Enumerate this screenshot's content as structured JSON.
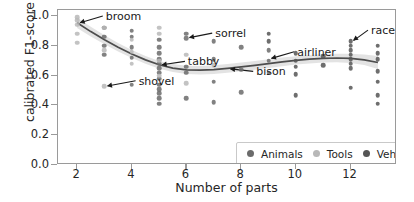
{
  "chart_data": {
    "type": "scatter",
    "title": "",
    "xlabel": "Number of parts",
    "ylabel": "calibrated F1-score",
    "xlim": [
      1.3,
      13.7
    ],
    "ylim": [
      0.0,
      1.04
    ],
    "xticks": [
      2,
      4,
      6,
      8,
      10,
      12
    ],
    "xtick_labels": [
      "2",
      "4",
      "6",
      "8",
      "10",
      "12"
    ],
    "yticks": [
      0.0,
      0.2,
      0.4,
      0.6,
      0.8,
      1.0
    ],
    "ytick_labels": [
      "0.0",
      "0.2",
      "0.4",
      "0.6",
      "0.8",
      "1.0"
    ],
    "grid": false,
    "legend_position": "lower right",
    "legend": [
      {
        "label": "Animals",
        "color": "#6b6b6b"
      },
      {
        "label": "Tools",
        "color": "#b8b8b8"
      },
      {
        "label": "Vehicles",
        "color": "#555555"
      }
    ],
    "series": [
      {
        "name": "Animals",
        "color": "#6b6b6b",
        "points": [
          [
            3.0,
            0.92
          ],
          [
            3.0,
            0.86
          ],
          [
            3.0,
            0.8
          ],
          [
            3.0,
            0.74
          ],
          [
            4.0,
            0.9
          ],
          [
            4.0,
            0.86
          ],
          [
            4.0,
            0.79
          ],
          [
            4.0,
            0.72
          ],
          [
            4.0,
            0.54
          ],
          [
            5.0,
            0.84
          ],
          [
            5.0,
            0.79
          ],
          [
            5.0,
            0.75
          ],
          [
            5.0,
            0.71
          ],
          [
            5.0,
            0.68
          ],
          [
            5.0,
            0.65
          ],
          [
            5.0,
            0.62
          ],
          [
            5.0,
            0.58
          ],
          [
            5.0,
            0.54
          ],
          [
            5.0,
            0.51
          ],
          [
            5.0,
            0.48
          ],
          [
            5.0,
            0.45
          ],
          [
            5.0,
            0.41
          ],
          [
            6.0,
            0.88
          ],
          [
            6.0,
            0.85
          ],
          [
            6.0,
            0.66
          ],
          [
            6.0,
            0.62
          ],
          [
            6.0,
            0.45
          ],
          [
            7.0,
            0.83
          ],
          [
            7.0,
            0.71
          ],
          [
            7.0,
            0.56
          ],
          [
            7.0,
            0.42
          ],
          [
            8.0,
            0.79
          ],
          [
            8.0,
            0.64
          ],
          [
            8.0,
            0.49
          ],
          [
            9.0,
            0.77
          ],
          [
            9.0,
            0.7
          ],
          [
            9.0,
            0.62
          ]
        ]
      },
      {
        "name": "Tools",
        "color": "#b8b8b8",
        "points": [
          [
            2.0,
            0.99
          ],
          [
            2.0,
            0.97
          ],
          [
            2.0,
            0.94
          ],
          [
            2.0,
            0.88
          ],
          [
            2.0,
            0.82
          ],
          [
            3.0,
            0.92
          ],
          [
            3.0,
            0.77
          ],
          [
            3.0,
            0.53
          ],
          [
            4.0,
            0.84
          ],
          [
            4.0,
            0.76
          ],
          [
            4.0,
            0.68
          ],
          [
            5.0,
            0.92
          ],
          [
            5.0,
            0.88
          ],
          [
            5.0,
            0.7
          ],
          [
            5.0,
            0.6
          ],
          [
            6.0,
            0.74
          ],
          [
            6.0,
            0.55
          ],
          [
            7.0,
            0.67
          ]
        ]
      },
      {
        "name": "Vehicles",
        "color": "#555555",
        "points": [
          [
            9.0,
            0.88
          ],
          [
            9.0,
            0.83
          ],
          [
            10.0,
            0.75
          ],
          [
            10.0,
            0.7
          ],
          [
            10.0,
            0.66
          ],
          [
            10.0,
            0.61
          ],
          [
            10.0,
            0.47
          ],
          [
            11.0,
            0.73
          ],
          [
            11.0,
            0.67
          ],
          [
            12.0,
            0.83
          ],
          [
            12.0,
            0.8
          ],
          [
            12.0,
            0.77
          ],
          [
            12.0,
            0.74
          ],
          [
            12.0,
            0.71
          ],
          [
            12.0,
            0.68
          ],
          [
            12.0,
            0.65
          ],
          [
            12.0,
            0.52
          ],
          [
            13.0,
            0.8
          ],
          [
            13.0,
            0.75
          ],
          [
            13.0,
            0.71
          ],
          [
            13.0,
            0.63
          ],
          [
            13.0,
            0.56
          ],
          [
            13.0,
            0.47
          ],
          [
            13.0,
            0.41
          ]
        ]
      }
    ],
    "trend_line": {
      "label": "fitted trend",
      "color": "#4d4d4d",
      "band_color": "#d9d9d9",
      "points": [
        [
          2.0,
          0.955
        ],
        [
          2.5,
          0.895
        ],
        [
          3.0,
          0.84
        ],
        [
          3.5,
          0.79
        ],
        [
          4.0,
          0.745
        ],
        [
          4.5,
          0.705
        ],
        [
          5.0,
          0.672
        ],
        [
          5.5,
          0.65
        ],
        [
          6.0,
          0.638
        ],
        [
          6.5,
          0.636
        ],
        [
          7.0,
          0.64
        ],
        [
          7.5,
          0.648
        ],
        [
          8.0,
          0.658
        ],
        [
          8.5,
          0.668
        ],
        [
          9.0,
          0.68
        ],
        [
          9.5,
          0.692
        ],
        [
          10.0,
          0.702
        ],
        [
          10.5,
          0.71
        ],
        [
          11.0,
          0.716
        ],
        [
          11.5,
          0.718
        ],
        [
          12.0,
          0.716
        ],
        [
          12.5,
          0.706
        ],
        [
          13.0,
          0.688
        ]
      ],
      "band_half_width": [
        0.035,
        0.032,
        0.03,
        0.028,
        0.027,
        0.026,
        0.026,
        0.027,
        0.028,
        0.029,
        0.029,
        0.029,
        0.029,
        0.029,
        0.029,
        0.029,
        0.028,
        0.028,
        0.028,
        0.029,
        0.031,
        0.036,
        0.044
      ]
    },
    "annotations": [
      {
        "text": "broom",
        "point": [
          2.0,
          0.955
        ],
        "label_x": 3.05,
        "label_y": 1.0,
        "arrow": "left"
      },
      {
        "text": "shovel",
        "point": [
          3.0,
          0.53
        ],
        "label_x": 4.25,
        "label_y": 0.565,
        "arrow": "left"
      },
      {
        "text": "tabby",
        "point": [
          5.0,
          0.672
        ],
        "label_x": 6.05,
        "label_y": 0.695,
        "arrow": "left"
      },
      {
        "text": "sorrel",
        "point": [
          6.0,
          0.855
        ],
        "label_x": 7.05,
        "label_y": 0.885,
        "arrow": "left"
      },
      {
        "text": "bison",
        "point": [
          7.5,
          0.645
        ],
        "label_x": 8.55,
        "label_y": 0.628,
        "arrow": "left"
      },
      {
        "text": "airliner",
        "point": [
          9.0,
          0.715
        ],
        "label_x": 10.05,
        "label_y": 0.76,
        "arrow": "left"
      },
      {
        "text": "racer",
        "point": [
          12.0,
          0.835
        ],
        "label_x": 12.75,
        "label_y": 0.905,
        "arrow": "left"
      }
    ]
  }
}
